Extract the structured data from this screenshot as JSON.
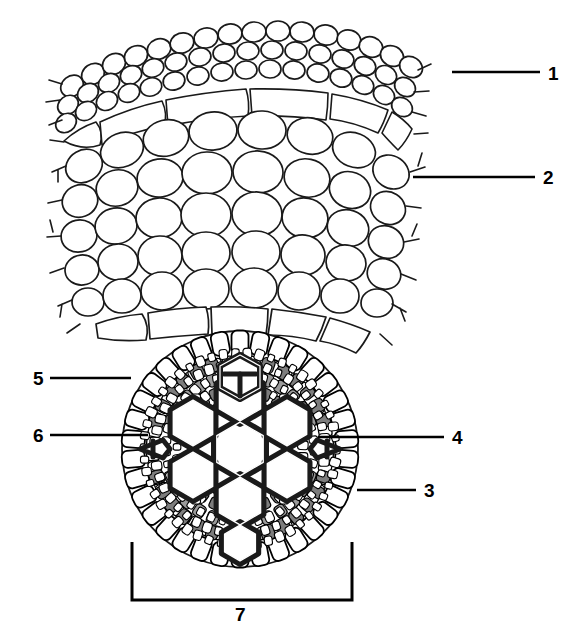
{
  "figure": {
    "background_color": "#ffffff",
    "ink_color": "#000000",
    "shade_color": "#9a9a9a",
    "shade_color_dark": "#7d7d7d",
    "width": 575,
    "height": 640
  },
  "labels": [
    {
      "id": "1",
      "text": "1",
      "x": 548,
      "y": 64,
      "leader": {
        "x1": 452,
        "y1": 72,
        "x2": 540,
        "y2": 72
      }
    },
    {
      "id": "2",
      "text": "2",
      "x": 543,
      "y": 168,
      "leader": {
        "x1": 413,
        "y1": 177,
        "x2": 535,
        "y2": 177
      }
    },
    {
      "id": "3",
      "text": "3",
      "x": 424,
      "y": 481,
      "leader": {
        "x1": 357,
        "y1": 490,
        "x2": 416,
        "y2": 490
      }
    },
    {
      "id": "4",
      "text": "4",
      "x": 452,
      "y": 428,
      "leader": {
        "x1": 318,
        "y1": 437,
        "x2": 444,
        "y2": 437
      }
    },
    {
      "id": "5",
      "text": "5",
      "x": 33,
      "y": 369,
      "leader": {
        "x1": 50,
        "y1": 378,
        "x2": 131,
        "y2": 378
      }
    },
    {
      "id": "6",
      "text": "6",
      "x": 33,
      "y": 426,
      "leader": {
        "x1": 50,
        "y1": 435,
        "x2": 148,
        "y2": 435
      }
    },
    {
      "id": "7",
      "text": "7",
      "x": 235,
      "y": 605,
      "leader": null
    }
  ],
  "bracket": {
    "label_id": "7",
    "x_left": 132,
    "x_right": 352,
    "y_top": 542,
    "y_bottom": 600
  },
  "structures": [
    {
      "number": "1",
      "name": "epidermis",
      "region": "outer small-cell layers of the cortex wedge"
    },
    {
      "number": "2",
      "name": "cortex",
      "region": "large rounded parenchyma cells"
    },
    {
      "number": "3",
      "name": "phloem",
      "region": "grey shaded patches inside the stele"
    },
    {
      "number": "4",
      "name": "xylem vessel",
      "region": "hexagonal thick-walled cells at the centre"
    },
    {
      "number": "5",
      "name": "endodermis",
      "region": "ring of large cells around the stele"
    },
    {
      "number": "6",
      "name": "pericycle",
      "region": "layer just inside the endodermis"
    },
    {
      "number": "7",
      "name": "stele",
      "region": "whole vascular cylinder, marked by the bracket"
    }
  ]
}
